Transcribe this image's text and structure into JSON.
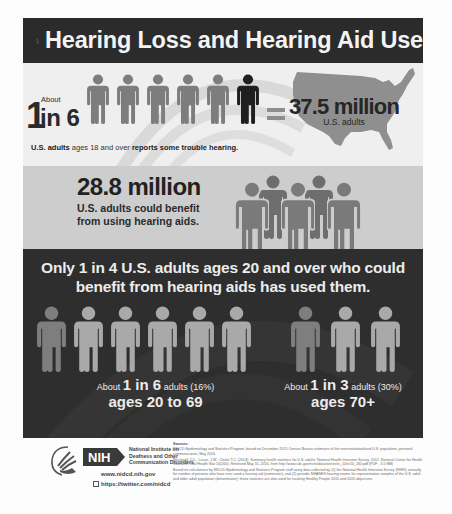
{
  "header": {
    "title": "Hearing Loss and Hearing Aid Use",
    "icon": "ear-minus-icon"
  },
  "section1": {
    "about_label": "About",
    "ratio_one": "1",
    "ratio_rest": "in 6",
    "figures_total": 6,
    "figures_highlighted": 1,
    "equals_symbol": "=",
    "stat_value": "37.5 million",
    "stat_label": "U.S. adults",
    "caption_bold_1": "U.S. adults",
    "caption_normal": " ages 18 and over ",
    "caption_bold_2": "reports some trouble hearing."
  },
  "section2": {
    "stat_value": "28.8 million",
    "stat_line1": "U.S. adults could benefit",
    "stat_line2": "from using hearing aids."
  },
  "section3": {
    "headline_line1": "Only 1 in 4 U.S. adults ages 20 and over who could",
    "headline_line2": "benefit from hearing aids has used them.",
    "left_group": {
      "about": "About ",
      "ratio": "1 in 6",
      "adults": " adults (16%)",
      "ages": "ages 20 to 69",
      "figures_total": 6,
      "figures_highlighted": 1
    },
    "right_group": {
      "about": "About ",
      "ratio": "1 in 3",
      "adults": " adults (30%)",
      "ages": "ages 70+",
      "figures_total": 3,
      "figures_highlighted": 1
    }
  },
  "footer": {
    "hhs_logo": "hhs-eagle-logo",
    "nih_logo": "NIH",
    "nidcd_line1": "National Institute on",
    "nidcd_line2": "Deafness and Other",
    "nidcd_line3": "Communication Disorders",
    "website": "www.nidcd.nih.gov",
    "twitter": "https://twitter.com/nidcd",
    "sources_title": "Sources:",
    "source_1": "NIDCD Epidemiology and Statistics Program, based on December 2015 Census Bureau estimates of the noninstitutionalized U.S. population, personal communication, May 2016.",
    "source_2": "Blackwell, D.L., Lucas, J.W., Clarke T.C. (2014). Summary health statistics for U.S. adults: National Health Interview Survey, 2012. National Center for Health Statistics. Vital Health Stat 10(260). Retrieved May 31, 2016, from http://www.cdc.gov/nchs/data/series/sr_10/sr10_260.pdf (PDF - 3.5 MB)",
    "source_3": "Based on calculations by NIDCD Epidemiology and Statistics Program staff using data collected by (1) the National Health Interview Survey (NHIS) annually for number of persons who have ever used a hearing aid (numerator), and (2) periodic NHANES hearing exams for representative samples of the U.S. adult and older adult population (denominator); these statistics are also used for tracking Healthy People 2010 and 2020 objectives."
  },
  "colors": {
    "header_bg": "#2b2b2b",
    "section1_bg": "#efefef",
    "section2_bg": "#cdcdcd",
    "section3_bg": "#2e2e2e",
    "figure_gray": "#7d7d7d",
    "figure_dark": "#1f1f1f",
    "figure_light": "#a9a9a9",
    "figure_light_highlight": "#7e7e7e",
    "map_gray": "#8f8f8f"
  }
}
